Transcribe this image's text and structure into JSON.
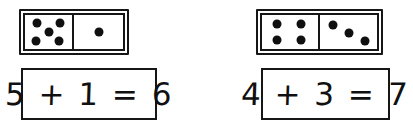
{
  "page": {
    "background_color": "#ffffff",
    "ink_color": "#101010"
  },
  "problems": [
    {
      "id": "problem-1",
      "domino": {
        "left_pips": 5,
        "right_pips": 1,
        "left_pattern": "quincunx",
        "right_pattern": "center"
      },
      "equation": {
        "text": "5 + 1 = 6",
        "addend_1": "5",
        "operator": "+",
        "addend_2": "1",
        "equals": "=",
        "sum": "6"
      }
    },
    {
      "id": "problem-2",
      "domino": {
        "left_pips": 4,
        "right_pips": 3,
        "left_pattern": "square",
        "right_pattern": "diagonal"
      },
      "equation": {
        "text": "4 + 3 = 7",
        "addend_1": "4",
        "operator": "+",
        "addend_2": "3",
        "equals": "=",
        "sum": "7"
      }
    }
  ]
}
